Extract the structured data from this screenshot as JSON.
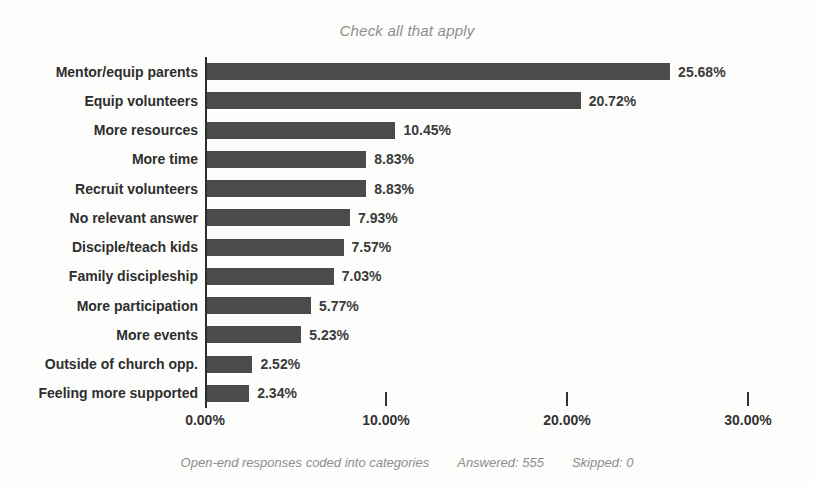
{
  "chart_data": {
    "type": "bar",
    "orientation": "horizontal",
    "title": "Check all that apply",
    "categories": [
      "Mentor/equip parents",
      "Equip volunteers",
      "More resources",
      "More time",
      "Recruit volunteers",
      "No relevant answer",
      "Disciple/teach kids",
      "Family discipleship",
      "More participation",
      "More events",
      "Outside of church opp.",
      "Feeling more supported"
    ],
    "values": [
      25.68,
      20.72,
      10.45,
      8.83,
      8.83,
      7.93,
      7.57,
      7.03,
      5.77,
      5.23,
      2.52,
      2.34
    ],
    "value_labels": [
      "25.68%",
      "20.72%",
      "10.45%",
      "8.83%",
      "8.83%",
      "7.93%",
      "7.57%",
      "7.03%",
      "5.77%",
      "5.23%",
      "2.52%",
      "2.34%"
    ],
    "xlabel": "",
    "ylabel": "",
    "xlim": [
      0,
      30
    ],
    "x_ticks": [
      "0.00%",
      "10.00%",
      "20.00%",
      "30.00%"
    ],
    "x_tick_values": [
      0,
      10,
      20,
      30
    ],
    "grid": false,
    "legend": false,
    "bar_color": "#4b4b4b",
    "axis_color": "#2e2e2e"
  },
  "footer": {
    "note": "Open-end responses coded into categories",
    "answered": "Answered: 555",
    "skipped": "Skipped: 0"
  }
}
